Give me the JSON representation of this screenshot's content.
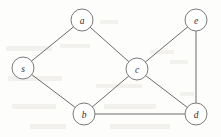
{
  "figure": {
    "kind": "undirected-graph-diagram",
    "title": "",
    "background_color": "#fdfdfc",
    "node_fill_color": "#ffffff",
    "node_stroke_color": "#7a7a7a",
    "edge_color": "#6b6b6b",
    "label_color": "#2f2f2f",
    "node_radius": 11
  },
  "chart_data": {
    "type": "diagram",
    "title": "",
    "nodes": [
      {
        "id": "s",
        "label": "s",
        "x": 23,
        "y": 68
      },
      {
        "id": "a",
        "label": "a",
        "x": 82,
        "y": 20
      },
      {
        "id": "b",
        "label": "b",
        "x": 84,
        "y": 114
      },
      {
        "id": "c",
        "label": "c",
        "x": 137,
        "y": 69
      },
      {
        "id": "d",
        "label": "d",
        "x": 196,
        "y": 114
      },
      {
        "id": "e",
        "label": "e",
        "x": 196,
        "y": 20
      }
    ],
    "edges": [
      {
        "from": "s",
        "to": "a"
      },
      {
        "from": "s",
        "to": "b"
      },
      {
        "from": "a",
        "to": "c"
      },
      {
        "from": "b",
        "to": "c"
      },
      {
        "from": "b",
        "to": "d"
      },
      {
        "from": "c",
        "to": "d"
      },
      {
        "from": "c",
        "to": "e"
      },
      {
        "from": "e",
        "to": "d"
      },
      {
        "from": "c",
        "to": "b"
      }
    ],
    "edge_count": 8,
    "node_count": 6,
    "directed": false,
    "weighted": false
  },
  "bleed_marks": [
    {
      "x": 6,
      "y": 46,
      "w": 46,
      "h": 5
    },
    {
      "x": 60,
      "y": 44,
      "w": 30,
      "h": 4
    },
    {
      "x": 100,
      "y": 20,
      "w": 18,
      "h": 4
    },
    {
      "x": 150,
      "y": 50,
      "w": 24,
      "h": 4
    },
    {
      "x": 8,
      "y": 76,
      "w": 54,
      "h": 5
    },
    {
      "x": 96,
      "y": 84,
      "w": 46,
      "h": 4
    },
    {
      "x": 12,
      "y": 104,
      "w": 44,
      "h": 5
    },
    {
      "x": 104,
      "y": 104,
      "w": 52,
      "h": 5
    },
    {
      "x": 30,
      "y": 124,
      "w": 36,
      "h": 5
    },
    {
      "x": 110,
      "y": 124,
      "w": 60,
      "h": 5
    },
    {
      "x": 170,
      "y": 60,
      "w": 18,
      "h": 4
    },
    {
      "x": 180,
      "y": 92,
      "w": 14,
      "h": 4
    }
  ]
}
